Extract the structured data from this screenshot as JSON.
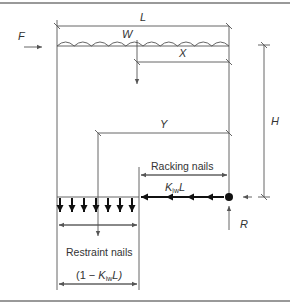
{
  "diagram": {
    "labels": {
      "force": "F",
      "length": "L",
      "load": "W",
      "load_offset": "X",
      "height": "H",
      "restraint_offset": "Y",
      "racking_nails": "Racking nails",
      "racking_length_k": "K",
      "racking_length_sub": "iw",
      "racking_length_l": "L",
      "reaction": "R",
      "restraint_nails": "Restraint nails",
      "restraint_length_prefix": "(1 − ",
      "restraint_length_k": "K",
      "restraint_length_sub": "iw",
      "restraint_length_suffix": "L)"
    },
    "colors": {
      "line": "#555555",
      "heavy": "#111111",
      "text": "#333333",
      "border": "#777777"
    },
    "counts": {
      "restraint_down_arrows": 7,
      "racking_left_arrows": 4,
      "load_arcs": 10
    }
  }
}
